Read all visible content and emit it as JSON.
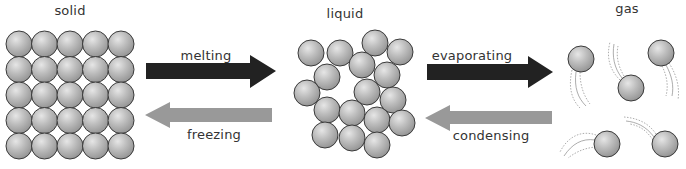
{
  "states": {
    "solid": {
      "label": "solid",
      "x": 70,
      "y": 4
    },
    "liquid": {
      "label": "liquid",
      "x": 345,
      "y": 7
    },
    "gas": {
      "label": "gas",
      "x": 627,
      "y": 2
    }
  },
  "transitions": {
    "melting": {
      "label": "melting",
      "x": 206,
      "y": 49,
      "direction": "right",
      "color": "#222222"
    },
    "freezing": {
      "label": "freezing",
      "x": 214,
      "y": 128,
      "direction": "left",
      "color": "#999999"
    },
    "evaporating": {
      "label": "evaporating",
      "x": 472,
      "y": 49,
      "direction": "right",
      "color": "#222222"
    },
    "condensing": {
      "label": "condensing",
      "x": 491,
      "y": 129,
      "direction": "left",
      "color": "#999999"
    }
  },
  "colors": {
    "particle_fill": "#b3b3b3",
    "particle_stroke": "#3a3a3a",
    "arrow_dark": "#222222",
    "arrow_light": "#999999",
    "trail": "#8a8a8a"
  },
  "particles": {
    "radius": 13,
    "solid_grid": {
      "cols": 5,
      "rows": 5,
      "x0": 19,
      "y0": 44,
      "spacing": 25.5
    },
    "liquid": [
      [
        311,
        53
      ],
      [
        340,
        53
      ],
      [
        375,
        43
      ],
      [
        400,
        52
      ],
      [
        327,
        77
      ],
      [
        362,
        65
      ],
      [
        387,
        75
      ],
      [
        307,
        93
      ],
      [
        367,
        92
      ],
      [
        393,
        100
      ],
      [
        327,
        110
      ],
      [
        352,
        113
      ],
      [
        377,
        120
      ],
      [
        402,
        123
      ],
      [
        325,
        135
      ],
      [
        352,
        138
      ],
      [
        377,
        145
      ]
    ],
    "gas": [
      [
        581,
        59
      ],
      [
        631,
        88
      ],
      [
        661,
        53
      ],
      [
        607,
        144
      ],
      [
        665,
        144
      ]
    ]
  }
}
